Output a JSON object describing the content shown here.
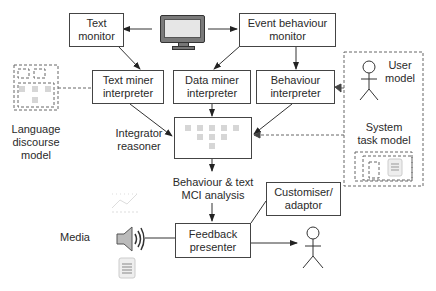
{
  "diagram": {
    "nodes": {
      "text_monitor": "Text\nmonitor",
      "event_behaviour_monitor": "Event behaviour\nmonitor",
      "text_miner_interpreter": "Text miner\ninterpreter",
      "data_miner_interpreter": "Data miner\ninterpreter",
      "behaviour_interpreter": "Behaviour\ninterpreter",
      "feedback_presenter": "Feedback\npresenter",
      "customiser_adaptor": "Customiser/\nadaptor"
    },
    "labels": {
      "language_discourse_model": "Language\ndiscourse\nmodel",
      "integrator_reasoner": "Integrator\nreasoner",
      "behaviour_text_mci": "Behaviour & text\nMCI analysis",
      "media": "Media",
      "user_model": "User\nmodel",
      "system_task_model": "System\ntask model"
    },
    "icons": [
      "computer-monitor-icon",
      "line-chart-icon",
      "speaker-icon",
      "document-icon",
      "stick-figure-icon"
    ],
    "colors": {
      "line": "#333333",
      "dashed": "#666666",
      "placeholder": "#d6d6d6",
      "monitor_body": "#7a7a7a"
    }
  }
}
